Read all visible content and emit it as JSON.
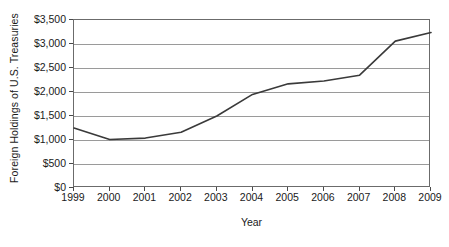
{
  "chart_data": {
    "type": "line",
    "title": "",
    "subtitle": "",
    "xlabel": "Year",
    "ylabel": "Foreign Holdings of U.S. Treasuries",
    "categories": [
      "1999",
      "2000",
      "2001",
      "2002",
      "2003",
      "2004",
      "2005",
      "2006",
      "2007",
      "2008",
      "2009"
    ],
    "x": [
      1999,
      2000,
      2001,
      2002,
      2003,
      2004,
      2005,
      2006,
      2007,
      2008,
      2009
    ],
    "values": [
      1250,
      1010,
      1040,
      1160,
      1500,
      1950,
      2170,
      2230,
      2350,
      3060,
      3240
    ],
    "series": [
      {
        "name": "Foreign Holdings of U.S. Treasuries",
        "values": [
          1250,
          1010,
          1040,
          1160,
          1500,
          1950,
          2170,
          2230,
          2350,
          3060,
          3240
        ]
      }
    ],
    "ylim": [
      0,
      3500
    ],
    "xlim": [
      1999,
      2009
    ],
    "ytick_labels": [
      "$0",
      "$500",
      "$1,000",
      "$1,500",
      "$2,000",
      "$2,500",
      "$3,000",
      "$3,500"
    ],
    "ytick_values": [
      0,
      500,
      1000,
      1500,
      2000,
      2500,
      3000,
      3500
    ],
    "units": "billions of U.S. dollars",
    "grid": true,
    "grid_axis": "y",
    "legend": false,
    "legend_position": "none",
    "line_color": "#3a3a3a",
    "grid_color": "#9a9a9a",
    "axis_color": "#6b6b6b",
    "background_color": "#ffffff",
    "annotations": []
  }
}
